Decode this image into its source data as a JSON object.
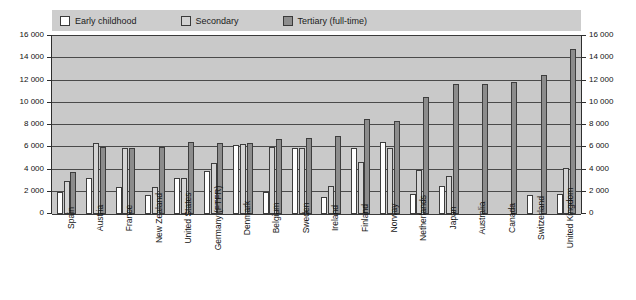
{
  "legend": {
    "items": [
      {
        "label": "Early childhood",
        "color": "#ffffff",
        "key": "early"
      },
      {
        "label": "Secondary",
        "color": "#d2d2d2",
        "key": "secondary"
      },
      {
        "label": "Tertiary (full-time)",
        "color": "#8e8e8e",
        "key": "tertiary"
      }
    ]
  },
  "axis": {
    "y_left_ticks": [
      "16 000",
      "14 000",
      "12 000",
      "10 000",
      "8 000",
      "6 000",
      "4 000",
      "2 000",
      "0"
    ],
    "y_right_ticks": [
      "16 000",
      "14 000",
      "12 000",
      "10 000",
      "8 000",
      "6 000",
      "4 000",
      "2 000",
      "0"
    ]
  },
  "chart_data": {
    "type": "bar",
    "title": "",
    "subtitle": "",
    "xlabel": "",
    "ylabel": "",
    "ylim": [
      0,
      16000
    ],
    "ytick_step": 2000,
    "grid": true,
    "legend_position": "top",
    "categories": [
      "Spain",
      "Austria",
      "France",
      "New Zealand",
      "United States",
      "Germany (FTFR)",
      "Denmark",
      "Belgium",
      "Sweden",
      "Ireland",
      "Finland",
      "Norway",
      "Netherlands",
      "Japan",
      "Australia",
      "Canada",
      "Switzerland",
      "United Kingdom"
    ],
    "series": [
      {
        "name": "Early childhood",
        "color": "#ffffff",
        "values": [
          2000,
          3200,
          2400,
          1700,
          3200,
          3900,
          6200,
          2000,
          5900,
          1500,
          5900,
          6500,
          1800,
          2500,
          null,
          null,
          1700,
          1800
        ]
      },
      {
        "name": "Secondary",
        "color": "#d2d2d2",
        "values": [
          3000,
          6400,
          5900,
          2400,
          3200,
          4600,
          6300,
          6000,
          5900,
          2500,
          4700,
          5900,
          4000,
          3400,
          null,
          null,
          null,
          4100
        ]
      },
      {
        "name": "Tertiary (full-time)",
        "color": "#8e8e8e",
        "values": [
          3800,
          6000,
          5900,
          6000,
          6500,
          6400,
          6400,
          6700,
          6800,
          7000,
          8500,
          8400,
          10500,
          11700,
          11700,
          11900,
          12500,
          14800
        ]
      }
    ]
  }
}
